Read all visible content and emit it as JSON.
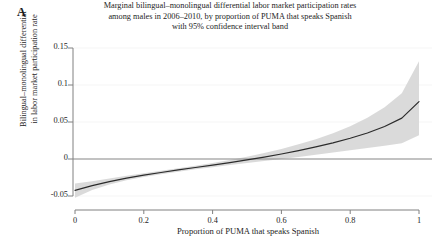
{
  "panel": {
    "label": "A"
  },
  "title": {
    "line1": "Marginal bilingual–monolingual differential labor market participation rates",
    "line2": "among males in 2006–2010, by proportion of PUMA that speaks Spanish",
    "line3": "with 95% confidence interval band"
  },
  "axes": {
    "xlabel": "Proportion of PUMA that speaks Spanish",
    "ylabel_line1": "Bilingual–monolingual differential",
    "ylabel_line2": "in labor market participation rate",
    "xticks": [
      "0",
      "0.2",
      "0.4",
      "0.6",
      "0.8",
      "1"
    ],
    "yticks": [
      "0.15",
      "0.1",
      "0.05",
      "0",
      "-0.05"
    ]
  },
  "colors": {
    "line": "#2b2b2b",
    "band": "#d6d6d6",
    "axis": "#808080",
    "zero_line": "#8a8a8a",
    "grid": "#f2f2f2",
    "background": "#ffffff"
  },
  "chart_data": {
    "type": "line",
    "title": "Marginal bilingual–monolingual differential labor market participation rates among males in 2006–2010, by proportion of PUMA that speaks Spanish with 95% confidence interval band",
    "xlabel": "Proportion of PUMA that speaks Spanish",
    "ylabel": "Bilingual–monolingual differential in labor market participation rate",
    "xlim": [
      0,
      1
    ],
    "ylim": [
      -0.065,
      0.165
    ],
    "xticks": [
      0,
      0.2,
      0.4,
      0.6,
      0.8,
      1
    ],
    "yticks": [
      -0.05,
      0,
      0.05,
      0.1,
      0.15
    ],
    "grid": false,
    "legend": null,
    "reference_lines": [
      {
        "y": 0,
        "style": "solid"
      }
    ],
    "x": [
      0.0,
      0.05,
      0.1,
      0.15,
      0.2,
      0.25,
      0.3,
      0.35,
      0.4,
      0.45,
      0.5,
      0.55,
      0.6,
      0.65,
      0.7,
      0.75,
      0.8,
      0.85,
      0.9,
      0.95,
      1.0
    ],
    "series": [
      {
        "name": "Estimate",
        "values": [
          -0.0425,
          -0.036,
          -0.0305,
          -0.0258,
          -0.0218,
          -0.0182,
          -0.0148,
          -0.0115,
          -0.0082,
          -0.0048,
          -0.0012,
          0.0026,
          0.0068,
          0.0113,
          0.0163,
          0.0218,
          0.028,
          0.0352,
          0.044,
          0.0552,
          0.0775
        ]
      },
      {
        "name": "CI upper (95%)",
        "values": [
          -0.033,
          -0.03,
          -0.0265,
          -0.0228,
          -0.0192,
          -0.0158,
          -0.0124,
          -0.009,
          -0.0054,
          -0.0014,
          0.003,
          0.008,
          0.0136,
          0.0198,
          0.0268,
          0.0348,
          0.0442,
          0.0556,
          0.07,
          0.089,
          0.132
        ]
      },
      {
        "name": "CI lower (95%)",
        "values": [
          -0.0525,
          -0.042,
          -0.0345,
          -0.0288,
          -0.0244,
          -0.0206,
          -0.0172,
          -0.014,
          -0.011,
          -0.0082,
          -0.0054,
          -0.0028,
          0.0,
          0.0028,
          0.0058,
          0.0088,
          0.0118,
          0.0148,
          0.018,
          0.0214,
          0.032
        ]
      }
    ],
    "zero_crossing_x": 0.52
  }
}
